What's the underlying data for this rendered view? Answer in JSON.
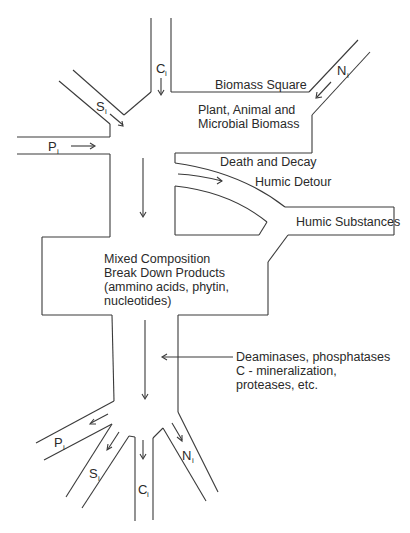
{
  "diagram": {
    "inputs": {
      "carbon": {
        "symbol": "C",
        "subscript": "i"
      },
      "sulfur": {
        "symbol": "S",
        "subscript": "i"
      },
      "phosphorus": {
        "symbol": "P",
        "subscript": "i"
      },
      "nitrogen": {
        "symbol": "N",
        "subscript": "i"
      }
    },
    "outputs": {
      "phosphorus": {
        "symbol": "P",
        "subscript": "i"
      },
      "sulfur": {
        "symbol": "S",
        "subscript": "i"
      },
      "carbon": {
        "symbol": "C",
        "subscript": "i"
      },
      "nitrogen": {
        "symbol": "N",
        "subscript": "i"
      }
    },
    "biomass_square": {
      "title": "Biomass Square",
      "content_lines": [
        "Plant, Animal and",
        "Microbial Biomass"
      ]
    },
    "death_and_decay": "Death and Decay",
    "humic_detour": "Humic Detour",
    "humic_substances": "Humic Substances",
    "mixed_products": {
      "lines": [
        "Mixed Composition",
        "Break Down Products",
        "(ammino acids, phytin,",
        "nucleotides)"
      ]
    },
    "enzymes_annotation": {
      "lines": [
        "Deaminases, phosphatases",
        "C - mineralization,",
        "proteases, etc."
      ]
    }
  }
}
